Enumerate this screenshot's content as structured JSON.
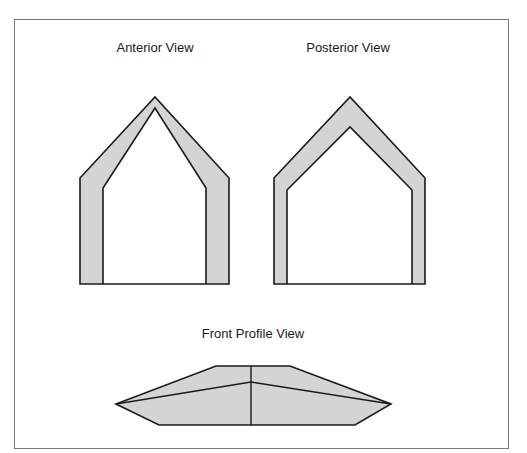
{
  "figure": {
    "panels": [
      {
        "id": "anterior",
        "title": "Anterior View"
      },
      {
        "id": "posterior",
        "title": "Posterior View"
      },
      {
        "id": "front-profile",
        "title": "Front Profile View"
      }
    ]
  },
  "colors": {
    "fill": "#d4d4d4",
    "stroke": "#1a1a1a",
    "frame": "#7a7a7a",
    "background": "#ffffff"
  }
}
